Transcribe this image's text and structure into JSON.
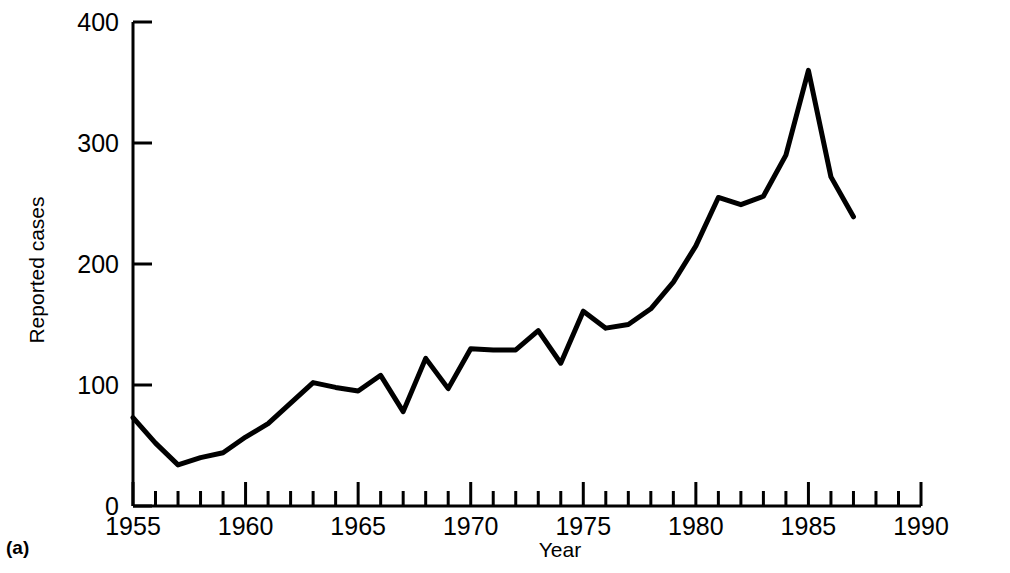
{
  "figure": {
    "panel_label": "(a)"
  },
  "chart_data": {
    "type": "line",
    "title": "",
    "subtitle": "",
    "xlabel": "Year",
    "ylabel": "Reported cases",
    "x": [
      1955,
      1956,
      1957,
      1958,
      1959,
      1960,
      1961,
      1962,
      1963,
      1964,
      1965,
      1966,
      1967,
      1968,
      1969,
      1970,
      1971,
      1972,
      1973,
      1974,
      1975,
      1976,
      1977,
      1978,
      1979,
      1980,
      1981,
      1982,
      1983,
      1984,
      1985,
      1986,
      1987
    ],
    "values": [
      73,
      52,
      34,
      40,
      44,
      57,
      68,
      85,
      102,
      98,
      95,
      108,
      78,
      122,
      97,
      130,
      129,
      129,
      145,
      118,
      161,
      147,
      150,
      163,
      185,
      215,
      255,
      249,
      256,
      290,
      360,
      272,
      239
    ],
    "series": [
      {
        "name": "Reported cases",
        "values": [
          73,
          52,
          34,
          40,
          44,
          57,
          68,
          85,
          102,
          98,
          95,
          108,
          78,
          122,
          97,
          130,
          129,
          129,
          145,
          118,
          161,
          147,
          150,
          163,
          185,
          215,
          255,
          249,
          256,
          290,
          360,
          272,
          239
        ]
      }
    ],
    "xlim": [
      1955,
      1990
    ],
    "ylim": [
      0,
      400
    ],
    "xticks_major": [
      1955,
      1960,
      1965,
      1970,
      1975,
      1980,
      1985,
      1990
    ],
    "xtick_labels": [
      "1955",
      "1960",
      "1965",
      "1970",
      "1975",
      "1980",
      "1985",
      "1990"
    ],
    "xtick_minor_step": 1,
    "yticks": [
      0,
      100,
      200,
      300,
      400
    ],
    "ytick_labels": [
      "0",
      "100",
      "200",
      "300",
      "400"
    ],
    "grid": false,
    "legend": "none",
    "line_color": "#000000",
    "line_width": 5,
    "axis_color": "#000000",
    "background": "#ffffff"
  }
}
